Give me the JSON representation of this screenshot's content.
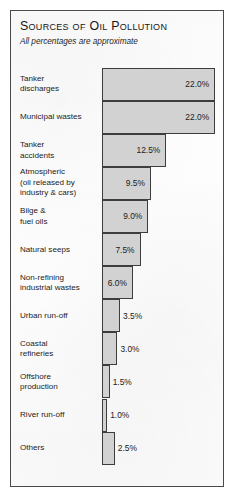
{
  "chart_data": {
    "type": "bar",
    "orientation": "horizontal",
    "title": "Sources of Oil Pollution",
    "subtitle": "All percentages are approximate",
    "xlabel": "",
    "ylabel": "",
    "unit": "%",
    "grid": false,
    "legend": null,
    "xlim": [
      0,
      22
    ],
    "categories": [
      "Tanker discharges",
      "Municipal wastes",
      "Tanker accidents",
      "Atmospheric (oil released by industry & cars)",
      "Bilge & fuel oils",
      "Natural seeps",
      "Non-refining industrial wastes",
      "Urban run-off",
      "Coastal refineries",
      "Offshore production",
      "River run-off",
      "Others"
    ],
    "values": [
      22.0,
      22.0,
      12.5,
      9.5,
      9.0,
      7.5,
      6.0,
      3.5,
      3.0,
      1.5,
      1.0,
      2.5
    ],
    "value_labels": [
      "22.0%",
      "22.0%",
      "12.5%",
      "9.5%",
      "9.0%",
      "7.5%",
      "6.0%",
      "3.5%",
      "3.0%",
      "1.5%",
      "1.0%",
      "2.5%"
    ],
    "colors": {
      "bar_fill": "#d2d2d2",
      "bar_stroke": "#3d3d3d",
      "frame": "#4a4a4a",
      "background": "#fdfdfd",
      "text": "#1a1a1a"
    }
  },
  "rows": [
    {
      "label_line1": "Tanker",
      "label_line2": "discharges",
      "value": "22.0%",
      "label_inside": true
    },
    {
      "label_line1": "Municipal wastes",
      "label_line2": "",
      "value": "22.0%",
      "label_inside": true
    },
    {
      "label_line1": "Tanker",
      "label_line2": "accidents",
      "value": "12.5%",
      "label_inside": true
    },
    {
      "label_line1": "Atmospheric",
      "label_line2": "(oil released by",
      "label_line3": "industry & cars)",
      "value": "9.5%",
      "label_inside": true
    },
    {
      "label_line1": "Bilge &",
      "label_line2": "fuel oils",
      "value": "9.0%",
      "label_inside": true
    },
    {
      "label_line1": "Natural seeps",
      "label_line2": "",
      "value": "7.5%",
      "label_inside": true
    },
    {
      "label_line1": "Non-refining",
      "label_line2": "industrial wastes",
      "value": "6.0%",
      "label_inside": true
    },
    {
      "label_line1": "Urban run-off",
      "label_line2": "",
      "value": "3.5%",
      "label_inside": false
    },
    {
      "label_line1": "Coastal",
      "label_line2": "refineries",
      "value": "3.0%",
      "label_inside": false
    },
    {
      "label_line1": "Offshore",
      "label_line2": "production",
      "value": "1.5%",
      "label_inside": false
    },
    {
      "label_line1": "River run-off",
      "label_line2": "",
      "value": "1.0%",
      "label_inside": false
    },
    {
      "label_line1": "Others",
      "label_line2": "",
      "value": "2.5%",
      "label_inside": false
    }
  ]
}
